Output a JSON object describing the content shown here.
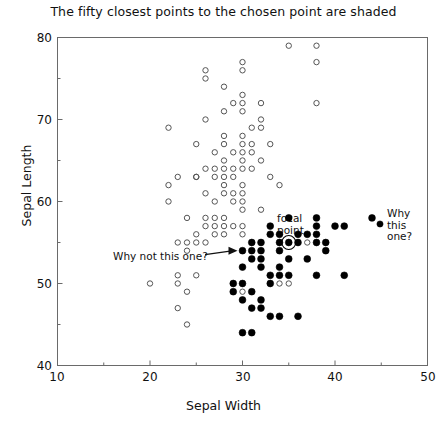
{
  "chart_data": {
    "type": "scatter",
    "title": "The fifty closest points to the chosen point are shaded",
    "xlabel": "Sepal Width",
    "ylabel": "Sepal Length",
    "xlim": [
      10,
      50
    ],
    "ylim": [
      40,
      80
    ],
    "xticks": [
      10,
      20,
      30,
      40,
      50
    ],
    "yticks": [
      40,
      50,
      60,
      70,
      80
    ],
    "xticklabels": [
      "10",
      "20",
      "30",
      "40",
      "50"
    ],
    "yticklabels": [
      "40",
      "50",
      "60",
      "70",
      "80"
    ],
    "xminorticks": [
      15,
      25,
      35,
      45
    ],
    "yminorticks": [
      45,
      55,
      65,
      75
    ],
    "grid": false,
    "legend": null,
    "series": [
      {
        "name": "unshaded",
        "marker": "open-circle",
        "color": "#555555",
        "points": [
          [
            35,
            79
          ],
          [
            38,
            79
          ],
          [
            38,
            77
          ],
          [
            30,
            77
          ],
          [
            26,
            76
          ],
          [
            30,
            76
          ],
          [
            26,
            75
          ],
          [
            28,
            74
          ],
          [
            30,
            73
          ],
          [
            29,
            72
          ],
          [
            30,
            72
          ],
          [
            32,
            72
          ],
          [
            38,
            72
          ],
          [
            28,
            71
          ],
          [
            30,
            71
          ],
          [
            26,
            70
          ],
          [
            32,
            70
          ],
          [
            22,
            69
          ],
          [
            31,
            69
          ],
          [
            32,
            69
          ],
          [
            30,
            68
          ],
          [
            28,
            68
          ],
          [
            28,
            67
          ],
          [
            30,
            67
          ],
          [
            31,
            67
          ],
          [
            33,
            67
          ],
          [
            25,
            67
          ],
          [
            30,
            66
          ],
          [
            29,
            66
          ],
          [
            31,
            66
          ],
          [
            27,
            66
          ],
          [
            30,
            65
          ],
          [
            32,
            65
          ],
          [
            28,
            65
          ],
          [
            30,
            64
          ],
          [
            31,
            64
          ],
          [
            28,
            64
          ],
          [
            29,
            64
          ],
          [
            27,
            64
          ],
          [
            26,
            64
          ],
          [
            25,
            63
          ],
          [
            27,
            63
          ],
          [
            28,
            63
          ],
          [
            23,
            63
          ],
          [
            33,
            63
          ],
          [
            25,
            63
          ],
          [
            29,
            63
          ],
          [
            30,
            62
          ],
          [
            34,
            62
          ],
          [
            28,
            62
          ],
          [
            22,
            62
          ],
          [
            29,
            61
          ],
          [
            28,
            61
          ],
          [
            30,
            61
          ],
          [
            26,
            61
          ],
          [
            30,
            60
          ],
          [
            27,
            60
          ],
          [
            22,
            60
          ],
          [
            29,
            60
          ],
          [
            32,
            59
          ],
          [
            30,
            59
          ],
          [
            27,
            58
          ],
          [
            26,
            58
          ],
          [
            28,
            58
          ],
          [
            24,
            58
          ],
          [
            27,
            57
          ],
          [
            30,
            57
          ],
          [
            28,
            57
          ],
          [
            26,
            57
          ],
          [
            29,
            57
          ],
          [
            25,
            56
          ],
          [
            30,
            56
          ],
          [
            27,
            56
          ],
          [
            28,
            56
          ],
          [
            23,
            55
          ],
          [
            24,
            55
          ],
          [
            25,
            55
          ],
          [
            26,
            55
          ],
          [
            24,
            54
          ],
          [
            37,
            55
          ],
          [
            20,
            50
          ],
          [
            23,
            51
          ],
          [
            24,
            49
          ],
          [
            23,
            50
          ],
          [
            25,
            51
          ],
          [
            24,
            45
          ],
          [
            34,
            50
          ],
          [
            35,
            50
          ],
          [
            30,
            49
          ],
          [
            23,
            47
          ]
        ]
      },
      {
        "name": "shaded",
        "marker": "filled-circle",
        "color": "#000000",
        "points": [
          [
            44,
            58
          ],
          [
            38,
            58
          ],
          [
            35,
            58
          ],
          [
            33,
            57
          ],
          [
            38,
            57
          ],
          [
            40,
            57
          ],
          [
            41,
            57
          ],
          [
            33,
            56
          ],
          [
            34,
            56
          ],
          [
            36,
            56
          ],
          [
            37,
            56
          ],
          [
            38,
            56
          ],
          [
            35,
            55
          ],
          [
            31,
            55
          ],
          [
            32,
            55
          ],
          [
            34,
            55
          ],
          [
            36,
            55
          ],
          [
            38,
            55
          ],
          [
            39,
            55
          ],
          [
            31,
            54
          ],
          [
            32,
            54
          ],
          [
            39,
            54
          ],
          [
            34,
            54
          ],
          [
            30,
            54
          ],
          [
            31,
            53
          ],
          [
            32,
            53
          ],
          [
            35,
            53
          ],
          [
            37,
            53
          ],
          [
            34,
            52
          ],
          [
            30,
            52
          ],
          [
            32,
            52
          ],
          [
            33,
            51
          ],
          [
            34,
            51
          ],
          [
            35,
            51
          ],
          [
            38,
            51
          ],
          [
            41,
            51
          ],
          [
            29,
            50
          ],
          [
            30,
            50
          ],
          [
            33,
            50
          ],
          [
            29,
            49
          ],
          [
            31,
            49
          ],
          [
            30,
            48
          ],
          [
            32,
            48
          ],
          [
            31,
            47
          ],
          [
            32,
            47
          ],
          [
            33,
            46
          ],
          [
            34,
            46
          ],
          [
            36,
            46
          ],
          [
            30,
            44
          ],
          [
            31,
            44
          ]
        ]
      }
    ],
    "annotations": [
      {
        "id": "focal-point",
        "text": "focal\npoint",
        "line1": "focal",
        "line2": "point",
        "target": [
          35,
          55
        ],
        "marker": "circled-filled-point"
      },
      {
        "id": "why-this-one",
        "line1": "Why",
        "line2": "this",
        "line3": "one?",
        "target": [
          44,
          58
        ],
        "marker": "filled-circle"
      },
      {
        "id": "why-not-this-one",
        "text": "Why not this one?",
        "target": [
          30,
          54
        ],
        "marker": "arrow-to-open-circle"
      }
    ]
  },
  "colors": {
    "open_point": "#555555",
    "filled_point": "#000000",
    "frame": "#6a6a6a",
    "text": "#111111",
    "background": "#ffffff"
  }
}
